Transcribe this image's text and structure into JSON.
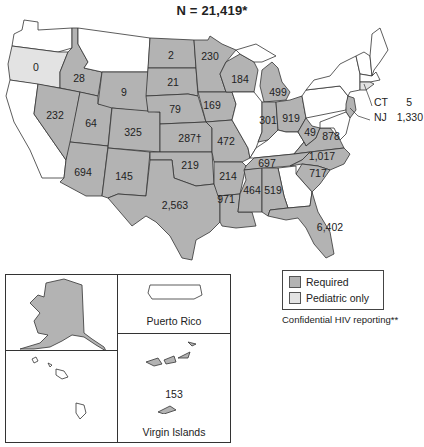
{
  "title": "N = 21,419*",
  "legend": {
    "items": [
      {
        "label": "Required",
        "color": "#b3b3b3"
      },
      {
        "label": "Pediatric only",
        "color": "#e3e3e3"
      }
    ],
    "note": "Confidential HIV reporting**"
  },
  "colors": {
    "required": "#b3b3b3",
    "pediatric_only": "#e3e3e3",
    "none": "#ffffff",
    "border": "#333333"
  },
  "states": {
    "OR": "0",
    "ID": "28",
    "NV": "232",
    "UT": "64",
    "AZ": "694",
    "WY": "9",
    "CO": "325",
    "NM": "145",
    "ND": "2",
    "SD": "21",
    "NE": "79",
    "KS": "287†",
    "OK": "219",
    "TX": "2,563",
    "MN": "230",
    "IA": "169",
    "MO": "472",
    "AR": "214",
    "LA": "971",
    "WI": "184",
    "MI": "499",
    "IN": "301",
    "OH": "919",
    "WV": "49",
    "VA": "878",
    "TN": "697",
    "MS": "464",
    "AL": "519",
    "NC": "1,017",
    "SC": "717",
    "FL": "6,402"
  },
  "callouts": {
    "ct": {
      "abbr": "CT",
      "value": "5"
    },
    "nj": {
      "abbr": "NJ",
      "value": "1,330"
    }
  },
  "insets": {
    "puerto_rico": {
      "label": "Puerto Rico"
    },
    "virgin_islands": {
      "label": "Virgin Islands",
      "value": "153"
    }
  }
}
